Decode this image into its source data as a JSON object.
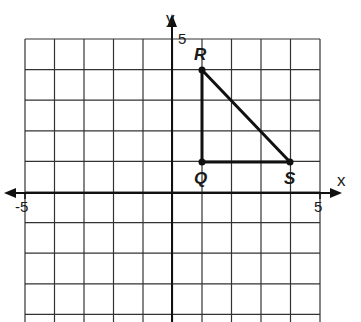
{
  "graph": {
    "x_axis_label": "x",
    "y_axis_label": "y",
    "x_min_label": "-5",
    "x_max_label": "5",
    "y_max_label": "5",
    "x_range": [
      -5,
      5
    ],
    "y_range": [
      -4,
      5
    ],
    "points": [
      {
        "name": "R",
        "x": 1,
        "y": 4
      },
      {
        "name": "Q",
        "x": 1,
        "y": 1
      },
      {
        "name": "S",
        "x": 4,
        "y": 1
      }
    ],
    "triangle": [
      "Q",
      "R",
      "S"
    ],
    "colors": {
      "line": "#1a1a1a",
      "grid": "#333333"
    }
  }
}
